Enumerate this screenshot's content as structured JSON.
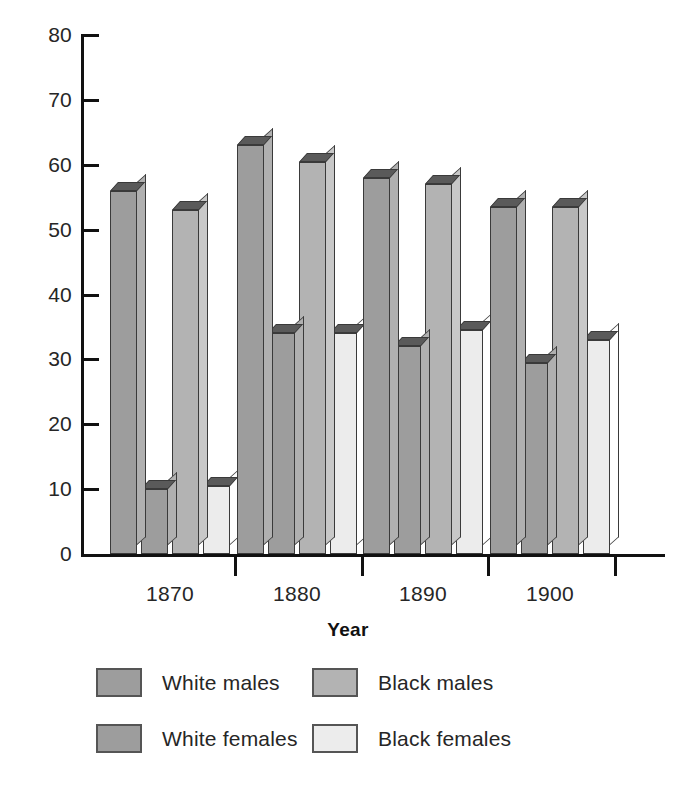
{
  "chart_data": {
    "type": "bar",
    "title": "",
    "xlabel": "Year",
    "ylabel": "",
    "categories": [
      "1870",
      "1880",
      "1890",
      "1900"
    ],
    "ylim": [
      0,
      80
    ],
    "yticks": [
      0,
      10,
      20,
      30,
      40,
      50,
      60,
      70,
      80
    ],
    "ytick_labels": [
      "0",
      "10",
      "20",
      "30",
      "40",
      "50",
      "60",
      "70",
      "80"
    ],
    "grid": false,
    "legend_position": "bottom",
    "series": [
      {
        "name": "White males",
        "color": "#9d9d9d",
        "values": [
          56,
          63,
          58,
          53.5
        ]
      },
      {
        "name": "White females",
        "color": "#9d9d9d",
        "values": [
          10,
          34,
          32,
          29.5
        ]
      },
      {
        "name": "Black males",
        "color": "#b3b3b3",
        "values": [
          53,
          60.5,
          57,
          53.5
        ]
      },
      {
        "name": "Black females",
        "color": "#ececec",
        "values": [
          10.5,
          34,
          34.5,
          33
        ]
      }
    ]
  },
  "axes": {
    "y_tick_labels": [
      "80",
      "70",
      "60",
      "50",
      "40",
      "30",
      "20",
      "10",
      "0"
    ],
    "x_tick_labels": [
      "1870",
      "1880",
      "1890",
      "1900"
    ],
    "x_axis_title": "Year"
  },
  "legend": {
    "items": [
      {
        "label": "White males",
        "color": "#9d9d9d"
      },
      {
        "label": "Black males",
        "color": "#b3b3b3"
      },
      {
        "label": "White females",
        "color": "#9d9d9d"
      },
      {
        "label": "Black females",
        "color": "#ececec"
      }
    ]
  },
  "colors": {
    "axis": "#111111",
    "text": "#262626",
    "bar_outline": "#3a3a3a",
    "bar_top_shade": "#5a5a5a",
    "background": "#ffffff"
  }
}
